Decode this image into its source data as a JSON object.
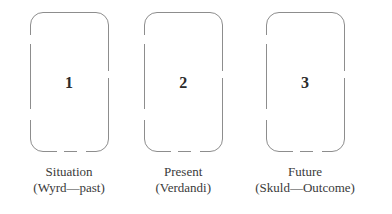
{
  "diagram": {
    "stroke_color": "#8d8d8d",
    "text_color": "#3a3a3a",
    "number_color": "#2b2b2b",
    "background_color": "#ffffff",
    "positions": [
      {
        "number": "1",
        "caption_primary": "Situation",
        "caption_secondary": "(Wyrd—past)"
      },
      {
        "number": "2",
        "caption_primary": "Present",
        "caption_secondary": "(Verdandi)"
      },
      {
        "number": "3",
        "caption_primary": "Future",
        "caption_secondary": "(Skuld—Outcome)"
      }
    ]
  }
}
